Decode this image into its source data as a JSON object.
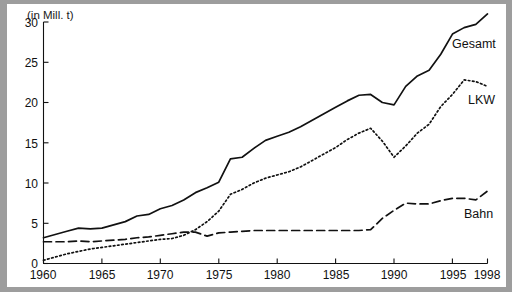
{
  "figure": {
    "axis_title": "(in Mill. t)",
    "y_ticks": [
      "30",
      "25",
      "20",
      "15",
      "10",
      "5",
      "0"
    ],
    "x_ticks": [
      "1960",
      "1965",
      "1970",
      "1975",
      "1980",
      "1985",
      "1990",
      "1995",
      "1998"
    ],
    "labels": {
      "gesamt": "Gesamt",
      "lkw": "LKW",
      "bahn": "Bahn"
    },
    "colors": {
      "ink": "#111111",
      "frame": "#9d9d9d",
      "background": "#ffffff"
    }
  },
  "chart_data": {
    "type": "line",
    "title": "",
    "subtitle": "",
    "xlabel": "",
    "ylabel": "(in Mill. t)",
    "xlim": [
      1960,
      1998
    ],
    "ylim": [
      0,
      30
    ],
    "y_ticks": [
      0,
      5,
      10,
      15,
      20,
      25,
      30
    ],
    "x_ticks": [
      1960,
      1965,
      1970,
      1975,
      1980,
      1985,
      1990,
      1995,
      1998
    ],
    "grid": false,
    "legend": "inline-right-of-curves",
    "x": [
      1960,
      1961,
      1962,
      1963,
      1964,
      1965,
      1966,
      1967,
      1968,
      1969,
      1970,
      1971,
      1972,
      1973,
      1974,
      1975,
      1976,
      1977,
      1978,
      1979,
      1980,
      1981,
      1982,
      1983,
      1984,
      1985,
      1986,
      1987,
      1988,
      1989,
      1990,
      1991,
      1992,
      1993,
      1994,
      1995,
      1996,
      1997,
      1998
    ],
    "series": [
      {
        "name": "Gesamt",
        "style": "solid",
        "values": [
          3.2,
          3.6,
          4.0,
          4.4,
          4.3,
          4.4,
          4.8,
          5.2,
          5.9,
          6.1,
          6.8,
          7.2,
          7.9,
          8.8,
          9.4,
          10.1,
          13.0,
          13.2,
          14.3,
          15.3,
          15.8,
          16.3,
          17.0,
          17.8,
          18.6,
          19.4,
          20.2,
          20.9,
          21.0,
          20.0,
          19.7,
          22.0,
          23.3,
          24.0,
          26.0,
          28.5,
          29.3,
          29.7,
          31.0
        ]
      },
      {
        "name": "LKW",
        "style": "dotted",
        "values": [
          0.4,
          0.8,
          1.2,
          1.5,
          1.8,
          2.0,
          2.2,
          2.4,
          2.6,
          2.8,
          3.0,
          3.1,
          3.5,
          4.2,
          5.2,
          6.5,
          8.6,
          9.2,
          10.0,
          10.6,
          11.0,
          11.4,
          12.0,
          12.8,
          13.6,
          14.4,
          15.4,
          16.2,
          16.8,
          15.2,
          13.2,
          14.6,
          16.2,
          17.3,
          19.5,
          21.0,
          22.8,
          22.6,
          22.0
        ]
      },
      {
        "name": "Bahn",
        "style": "dashed",
        "values": [
          2.7,
          2.7,
          2.7,
          2.8,
          2.7,
          2.8,
          2.9,
          3.0,
          3.2,
          3.3,
          3.5,
          3.7,
          3.9,
          3.9,
          3.4,
          3.8,
          3.9,
          4.0,
          4.1,
          4.1,
          4.1,
          4.1,
          4.1,
          4.1,
          4.1,
          4.1,
          4.1,
          4.1,
          4.2,
          5.6,
          6.6,
          7.5,
          7.4,
          7.4,
          7.8,
          8.1,
          8.1,
          7.9,
          9.0
        ]
      }
    ]
  }
}
